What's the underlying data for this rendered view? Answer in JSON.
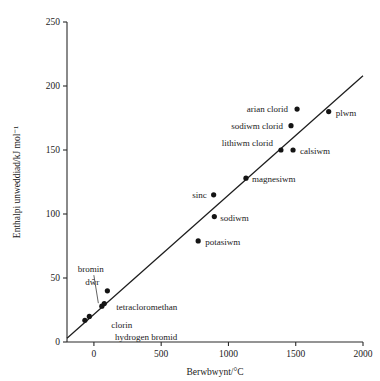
{
  "chart_data": {
    "type": "scatter",
    "title": "",
    "xlabel": "Berwbwynt/°C",
    "ylabel": "Enthalpi unweddiad/kJ mol⁻¹",
    "xlim": [
      -200,
      2000
    ],
    "ylim": [
      0,
      250
    ],
    "xticks": [
      "0",
      "500",
      "1000",
      "1500",
      "2000"
    ],
    "xtick_values": [
      0,
      500,
      1000,
      1500,
      2000
    ],
    "yticks": [
      "0",
      "50",
      "100",
      "150",
      "200",
      "250"
    ],
    "ytick_values": [
      0,
      50,
      100,
      150,
      200,
      250
    ],
    "grid": false,
    "legend": "none",
    "trendline": {
      "x": [
        -200,
        2000
      ],
      "y": [
        3,
        208
      ],
      "style": "solid"
    },
    "points": [
      {
        "label": "hydrogen bromid",
        "x": -67,
        "y": 17,
        "label_dx": 30,
        "label_dy": 20,
        "anchor": "start",
        "leader": false
      },
      {
        "label": "clorin",
        "x": -34,
        "y": 20,
        "label_dx": 22,
        "label_dy": 12,
        "anchor": "start",
        "leader": false
      },
      {
        "label": "bromin",
        "x": 59,
        "y": 28,
        "label_dx": -24,
        "label_dy": -34,
        "anchor": "start",
        "leader": true
      },
      {
        "label": "tetracloromethan",
        "x": 77,
        "y": 30,
        "label_dx": 12,
        "label_dy": 6,
        "anchor": "start",
        "leader": false
      },
      {
        "label": "dŵr",
        "x": 100,
        "y": 40,
        "label_dx": -8,
        "label_dy": -6,
        "anchor": "end",
        "leader": false
      },
      {
        "label": "potasiwm",
        "x": 775,
        "y": 79,
        "label_dx": 7,
        "label_dy": 4,
        "anchor": "start",
        "leader": false
      },
      {
        "label": "sodiwm",
        "x": 895,
        "y": 98,
        "label_dx": 6,
        "label_dy": 4,
        "anchor": "start",
        "leader": false
      },
      {
        "label": "sinc",
        "x": 890,
        "y": 115,
        "label_dx": -7,
        "label_dy": 3,
        "anchor": "end",
        "leader": false
      },
      {
        "label": "magnesiwm",
        "x": 1130,
        "y": 128,
        "label_dx": 6,
        "label_dy": 4,
        "anchor": "start",
        "leader": false
      },
      {
        "label": "lithiwm clorid",
        "x": 1390,
        "y": 150,
        "label_dx": -8,
        "label_dy": -4,
        "anchor": "end",
        "leader": false
      },
      {
        "label": "calsiwm",
        "x": 1480,
        "y": 150,
        "label_dx": 7,
        "label_dy": 4,
        "anchor": "start",
        "leader": false
      },
      {
        "label": "sodiwm clorid",
        "x": 1465,
        "y": 169,
        "label_dx": -8,
        "label_dy": 3,
        "anchor": "end",
        "leader": false
      },
      {
        "label": "arian clorid",
        "x": 1510,
        "y": 182,
        "label_dx": -9,
        "label_dy": 3,
        "anchor": "end",
        "leader": false
      },
      {
        "label": "plwm",
        "x": 1745,
        "y": 180,
        "label_dx": 7,
        "label_dy": 4,
        "anchor": "start",
        "leader": false
      }
    ]
  }
}
